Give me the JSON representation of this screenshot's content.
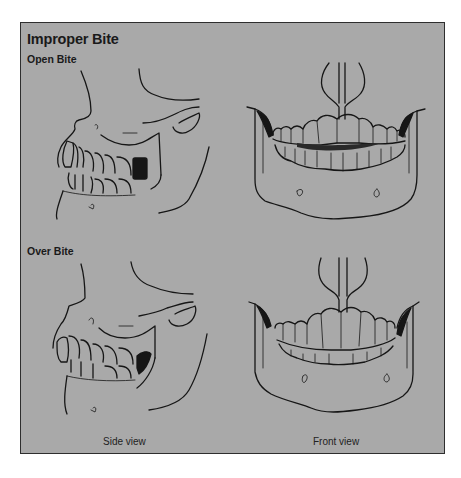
{
  "figure": {
    "title": "Improper Bite",
    "sections": [
      {
        "label": "Open Bite"
      },
      {
        "label": "Over Bite"
      }
    ],
    "column_labels": {
      "side": "Side view",
      "front": "Front view"
    },
    "colors": {
      "panel_background": "#a9a9a9",
      "line": "#161616",
      "border": "#2e2e2e"
    },
    "illustrations": [
      {
        "name": "open-bite-side-view",
        "description": "side profile of skull and jaw with teeth not meeting at front"
      },
      {
        "name": "open-bite-front-view",
        "description": "front view of jaw with dark gap between upper and lower teeth"
      },
      {
        "name": "over-bite-side-view",
        "description": "side profile of skull and jaw with upper teeth overlapping lower teeth"
      },
      {
        "name": "over-bite-front-view",
        "description": "front view of jaw with upper teeth overlapping lower teeth"
      }
    ]
  }
}
